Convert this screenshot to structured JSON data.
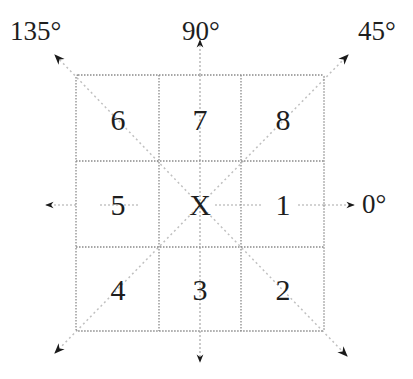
{
  "diagram": {
    "center_label": "X",
    "cells": [
      {
        "label": "6",
        "row": 0,
        "col": 0
      },
      {
        "label": "7",
        "row": 0,
        "col": 1
      },
      {
        "label": "8",
        "row": 0,
        "col": 2
      },
      {
        "label": "5",
        "row": 1,
        "col": 0
      },
      {
        "label": "X",
        "row": 1,
        "col": 1
      },
      {
        "label": "1",
        "row": 1,
        "col": 2
      },
      {
        "label": "4",
        "row": 2,
        "col": 0
      },
      {
        "label": "3",
        "row": 2,
        "col": 1
      },
      {
        "label": "2",
        "row": 2,
        "col": 2
      }
    ],
    "angles": {
      "a0": "0°",
      "a45": "45°",
      "a90": "90°",
      "a135": "135°"
    },
    "colors": {
      "grid_line": "#8a8a8a",
      "diagonal_line": "#c8c8c8",
      "arrow": "#1a1a1a",
      "text": "#1e1e1e"
    }
  }
}
